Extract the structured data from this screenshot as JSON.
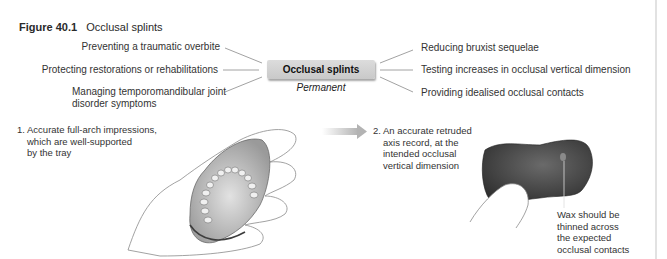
{
  "figure": {
    "number": "Figure 40.1",
    "title": "Occlusal splints"
  },
  "diagram": {
    "center": {
      "label": "Occlusal splints",
      "subtitle": "Permanent"
    },
    "left_items": [
      {
        "label": "Preventing a traumatic overbite"
      },
      {
        "label": "Protecting restorations or rehabilitations"
      },
      {
        "line1": "Managing temporomandibular joint",
        "line2": "disorder symptoms"
      }
    ],
    "right_items": [
      {
        "label": "Reducing bruxist sequelae"
      },
      {
        "label": "Testing increases in occlusal vertical dimension"
      },
      {
        "label": "Providing idealised occlusal contacts"
      }
    ]
  },
  "steps": [
    {
      "line1": "1. Accurate full-arch impressions,",
      "line2": "which are well-supported",
      "line3": "by the tray",
      "image": "hand-holding-impression-tray-illustration"
    },
    {
      "line1": "2. An accurate retruded",
      "line2": "axis record, at the",
      "line3": "intended occlusal",
      "line4": "vertical dimension",
      "image": "wax-bite-record-illustration"
    }
  ],
  "annotation": {
    "line1": "Wax should be",
    "line2": "thinned across",
    "line3": "the expected",
    "line4": "occlusal contacts"
  },
  "icons": {
    "arrow": "right-arrow-gradient"
  },
  "colors": {
    "center_box": "#cfcfcf",
    "text": "#2a2a2a",
    "connector": "#8a8a8a",
    "arrow": "#b8b8b8",
    "wax": "#3e3e3e"
  }
}
